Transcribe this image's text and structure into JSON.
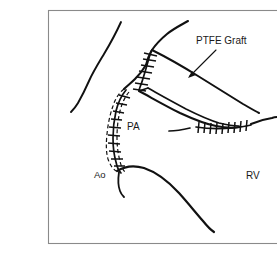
{
  "figure": {
    "kind": "surgical-illustration",
    "background_color": "#ffffff",
    "ink_color": "#111111",
    "frame": {
      "border_color": "#8a8a8a",
      "x": 48,
      "y": 10,
      "width": 236,
      "height": 233
    },
    "labels": [
      {
        "id": "ptfe-graft",
        "text": "PTFE Graft",
        "x": 196,
        "y": 44,
        "anchor": "start",
        "has_leader": true
      },
      {
        "id": "pa",
        "text": "PA",
        "x": 127,
        "y": 130,
        "anchor": "start",
        "has_leader": false
      },
      {
        "id": "ao",
        "text": "Ao",
        "x": 94,
        "y": 178,
        "anchor": "start",
        "has_leader": false
      },
      {
        "id": "rv",
        "text": "RV",
        "x": 246,
        "y": 179,
        "anchor": "start",
        "has_leader": false
      }
    ],
    "leader": {
      "id": "ptfe-graft-arrow",
      "from_x": 216,
      "from_y": 50,
      "to_x": 188,
      "to_y": 77
    },
    "structures": [
      {
        "id": "left-vessel-contour",
        "name": "left aortic contour"
      },
      {
        "id": "upper-vessel-contour",
        "name": "upper pulmonary contour"
      },
      {
        "id": "pa-stump-outline",
        "name": "oversewn pulmonary artery stump"
      },
      {
        "id": "graft-body",
        "name": "PTFE graft conduit body"
      },
      {
        "id": "graft-inner-lumen",
        "name": "graft inner lumen edge"
      },
      {
        "id": "lower-vessel-contour",
        "name": "lower ventricular contour"
      },
      {
        "id": "proximal-anastomosis",
        "name": "proximal suture line"
      },
      {
        "id": "distal-anastomosis",
        "name": "distal suture line at right ventricle"
      },
      {
        "id": "pa-stump-suture",
        "name": "pulmonary artery stump suture line"
      }
    ]
  }
}
